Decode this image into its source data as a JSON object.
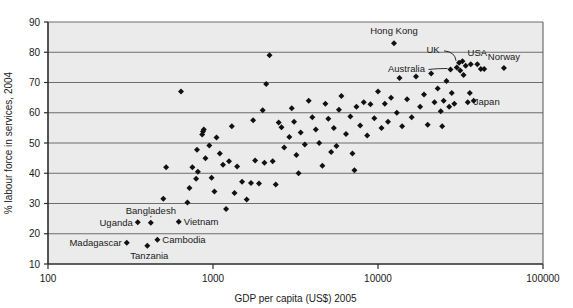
{
  "chart_data": {
    "type": "scatter",
    "title": "",
    "xlabel": "GDP per capita (US$) 2005",
    "ylabel": "% labour force in services, 2004",
    "xscale": "log",
    "yscale": "linear",
    "xlim": [
      100,
      100000
    ],
    "ylim": [
      10,
      90
    ],
    "xticks": [
      100,
      1000,
      10000,
      100000
    ],
    "xtick_labels": [
      "100",
      "1000",
      "10000",
      "100000"
    ],
    "yticks": [
      10,
      20,
      30,
      40,
      50,
      60,
      70,
      80,
      90
    ],
    "ytick_labels": [
      "10",
      "20",
      "30",
      "40",
      "50",
      "60",
      "70",
      "80",
      "90"
    ],
    "grid": "horizontal",
    "legend": "none",
    "marker": "diamond",
    "marker_color": "#111111",
    "plot_background": "#ebebeb",
    "points": [
      {
        "x": 300,
        "y": 17.0,
        "label": "Madagascar",
        "label_pos": "left"
      },
      {
        "x": 350,
        "y": 23.8,
        "label": "Uganda",
        "label_pos": "left"
      },
      {
        "x": 400,
        "y": 16.0,
        "label": "Tanzania",
        "label_pos": "below"
      },
      {
        "x": 420,
        "y": 23.6,
        "label": "Bangladesh",
        "label_pos": "above"
      },
      {
        "x": 460,
        "y": 18.0,
        "label": "Cambodia",
        "label_pos": "right"
      },
      {
        "x": 620,
        "y": 24.0,
        "label": "Vietnam",
        "label_pos": "right"
      },
      {
        "x": 12500,
        "y": 83.0,
        "label": "Hong Kong",
        "label_pos": "above"
      },
      {
        "x": 31000,
        "y": 76.5,
        "label": "UK",
        "label_pos": "leader-up-left"
      },
      {
        "x": 27500,
        "y": 74.3,
        "label": "Australia",
        "label_pos": "leader-left"
      },
      {
        "x": 40000,
        "y": 76.0,
        "label": "USA",
        "label_pos": "above"
      },
      {
        "x": 58000,
        "y": 74.8,
        "label": "Norway",
        "label_pos": "above"
      },
      {
        "x": 36000,
        "y": 66.5,
        "label": "Japan",
        "label_pos": "below-right"
      },
      {
        "x": 500,
        "y": 31.6,
        "label": "",
        "label_pos": ""
      },
      {
        "x": 520,
        "y": 42.0,
        "label": "",
        "label_pos": ""
      },
      {
        "x": 640,
        "y": 67.0,
        "label": "",
        "label_pos": ""
      },
      {
        "x": 700,
        "y": 30.3,
        "label": "",
        "label_pos": ""
      },
      {
        "x": 720,
        "y": 35.1,
        "label": "",
        "label_pos": ""
      },
      {
        "x": 750,
        "y": 42.0,
        "label": "",
        "label_pos": ""
      },
      {
        "x": 790,
        "y": 38.2,
        "label": "",
        "label_pos": ""
      },
      {
        "x": 800,
        "y": 47.8,
        "label": "",
        "label_pos": ""
      },
      {
        "x": 810,
        "y": 40.5,
        "label": "",
        "label_pos": ""
      },
      {
        "x": 860,
        "y": 52.8,
        "label": "",
        "label_pos": ""
      },
      {
        "x": 870,
        "y": 53.8,
        "label": "",
        "label_pos": ""
      },
      {
        "x": 880,
        "y": 54.5,
        "label": "",
        "label_pos": ""
      },
      {
        "x": 900,
        "y": 45.0,
        "label": "",
        "label_pos": ""
      },
      {
        "x": 950,
        "y": 49.2,
        "label": "",
        "label_pos": ""
      },
      {
        "x": 1050,
        "y": 51.8,
        "label": "",
        "label_pos": ""
      },
      {
        "x": 1100,
        "y": 46.5,
        "label": "",
        "label_pos": ""
      },
      {
        "x": 1150,
        "y": 42.8,
        "label": "",
        "label_pos": ""
      },
      {
        "x": 1200,
        "y": 28.2,
        "label": "",
        "label_pos": ""
      },
      {
        "x": 1250,
        "y": 44.0,
        "label": "",
        "label_pos": ""
      },
      {
        "x": 1300,
        "y": 55.5,
        "label": "",
        "label_pos": ""
      },
      {
        "x": 1400,
        "y": 42.2,
        "label": "",
        "label_pos": ""
      },
      {
        "x": 1500,
        "y": 37.2,
        "label": "",
        "label_pos": ""
      },
      {
        "x": 1600,
        "y": 31.3,
        "label": "",
        "label_pos": ""
      },
      {
        "x": 1700,
        "y": 36.8,
        "label": "",
        "label_pos": ""
      },
      {
        "x": 1750,
        "y": 57.5,
        "label": "",
        "label_pos": ""
      },
      {
        "x": 1900,
        "y": 36.6,
        "label": "",
        "label_pos": ""
      },
      {
        "x": 2000,
        "y": 60.8,
        "label": "",
        "label_pos": ""
      },
      {
        "x": 2100,
        "y": 69.5,
        "label": "",
        "label_pos": ""
      },
      {
        "x": 2200,
        "y": 79.0,
        "label": "",
        "label_pos": ""
      },
      {
        "x": 2300,
        "y": 44.0,
        "label": "",
        "label_pos": ""
      },
      {
        "x": 2400,
        "y": 36.3,
        "label": "",
        "label_pos": ""
      },
      {
        "x": 2500,
        "y": 56.8,
        "label": "",
        "label_pos": ""
      },
      {
        "x": 2600,
        "y": 55.2,
        "label": "",
        "label_pos": ""
      },
      {
        "x": 2700,
        "y": 48.5,
        "label": "",
        "label_pos": ""
      },
      {
        "x": 2900,
        "y": 52.0,
        "label": "",
        "label_pos": ""
      },
      {
        "x": 3000,
        "y": 61.5,
        "label": "",
        "label_pos": ""
      },
      {
        "x": 3100,
        "y": 57.0,
        "label": "",
        "label_pos": ""
      },
      {
        "x": 3200,
        "y": 46.0,
        "label": "",
        "label_pos": ""
      },
      {
        "x": 3400,
        "y": 53.5,
        "label": "",
        "label_pos": ""
      },
      {
        "x": 3600,
        "y": 49.5,
        "label": "",
        "label_pos": ""
      },
      {
        "x": 3800,
        "y": 64.0,
        "label": "",
        "label_pos": ""
      },
      {
        "x": 4000,
        "y": 58.5,
        "label": "",
        "label_pos": ""
      },
      {
        "x": 4200,
        "y": 54.5,
        "label": "",
        "label_pos": ""
      },
      {
        "x": 4400,
        "y": 50.0,
        "label": "",
        "label_pos": ""
      },
      {
        "x": 4600,
        "y": 42.5,
        "label": "",
        "label_pos": ""
      },
      {
        "x": 4800,
        "y": 63.0,
        "label": "",
        "label_pos": ""
      },
      {
        "x": 5000,
        "y": 58.0,
        "label": "",
        "label_pos": ""
      },
      {
        "x": 5200,
        "y": 47.0,
        "label": "",
        "label_pos": ""
      },
      {
        "x": 5400,
        "y": 55.0,
        "label": "",
        "label_pos": ""
      },
      {
        "x": 5600,
        "y": 49.0,
        "label": "",
        "label_pos": ""
      },
      {
        "x": 5800,
        "y": 61.0,
        "label": "",
        "label_pos": ""
      },
      {
        "x": 6000,
        "y": 65.5,
        "label": "",
        "label_pos": ""
      },
      {
        "x": 6400,
        "y": 53.0,
        "label": "",
        "label_pos": ""
      },
      {
        "x": 6800,
        "y": 58.8,
        "label": "",
        "label_pos": ""
      },
      {
        "x": 7000,
        "y": 46.5,
        "label": "",
        "label_pos": ""
      },
      {
        "x": 7400,
        "y": 62.0,
        "label": "",
        "label_pos": ""
      },
      {
        "x": 7800,
        "y": 55.8,
        "label": "",
        "label_pos": ""
      },
      {
        "x": 8200,
        "y": 63.5,
        "label": "",
        "label_pos": ""
      },
      {
        "x": 8600,
        "y": 52.5,
        "label": "",
        "label_pos": ""
      },
      {
        "x": 9000,
        "y": 62.8,
        "label": "",
        "label_pos": ""
      },
      {
        "x": 9500,
        "y": 58.2,
        "label": "",
        "label_pos": ""
      },
      {
        "x": 10000,
        "y": 67.0,
        "label": "",
        "label_pos": ""
      },
      {
        "x": 10500,
        "y": 55.0,
        "label": "",
        "label_pos": ""
      },
      {
        "x": 11000,
        "y": 63.0,
        "label": "",
        "label_pos": ""
      },
      {
        "x": 11500,
        "y": 57.0,
        "label": "",
        "label_pos": ""
      },
      {
        "x": 12000,
        "y": 65.0,
        "label": "",
        "label_pos": ""
      },
      {
        "x": 13000,
        "y": 60.0,
        "label": "",
        "label_pos": ""
      },
      {
        "x": 13500,
        "y": 71.5,
        "label": "",
        "label_pos": ""
      },
      {
        "x": 14000,
        "y": 55.5,
        "label": "",
        "label_pos": ""
      },
      {
        "x": 15000,
        "y": 64.5,
        "label": "",
        "label_pos": ""
      },
      {
        "x": 16000,
        "y": 58.5,
        "label": "",
        "label_pos": ""
      },
      {
        "x": 17000,
        "y": 72.0,
        "label": "",
        "label_pos": ""
      },
      {
        "x": 18000,
        "y": 62.0,
        "label": "",
        "label_pos": ""
      },
      {
        "x": 19000,
        "y": 66.0,
        "label": "",
        "label_pos": ""
      },
      {
        "x": 20000,
        "y": 56.0,
        "label": "",
        "label_pos": ""
      },
      {
        "x": 21000,
        "y": 73.0,
        "label": "",
        "label_pos": ""
      },
      {
        "x": 22000,
        "y": 63.5,
        "label": "",
        "label_pos": ""
      },
      {
        "x": 23000,
        "y": 68.0,
        "label": "",
        "label_pos": ""
      },
      {
        "x": 24000,
        "y": 60.5,
        "label": "",
        "label_pos": ""
      },
      {
        "x": 25000,
        "y": 64.0,
        "label": "",
        "label_pos": ""
      },
      {
        "x": 26000,
        "y": 70.5,
        "label": "",
        "label_pos": ""
      },
      {
        "x": 28000,
        "y": 66.5,
        "label": "",
        "label_pos": ""
      },
      {
        "x": 29000,
        "y": 63.0,
        "label": "",
        "label_pos": ""
      },
      {
        "x": 30000,
        "y": 75.0,
        "label": "",
        "label_pos": ""
      },
      {
        "x": 31500,
        "y": 74.0,
        "label": "",
        "label_pos": ""
      },
      {
        "x": 32500,
        "y": 77.0,
        "label": "",
        "label_pos": ""
      },
      {
        "x": 33000,
        "y": 72.5,
        "label": "",
        "label_pos": ""
      },
      {
        "x": 34000,
        "y": 75.5,
        "label": "",
        "label_pos": ""
      },
      {
        "x": 35000,
        "y": 63.5,
        "label": "",
        "label_pos": ""
      },
      {
        "x": 36500,
        "y": 76.0,
        "label": "",
        "label_pos": ""
      },
      {
        "x": 38000,
        "y": 64.0,
        "label": "",
        "label_pos": ""
      },
      {
        "x": 42000,
        "y": 74.5,
        "label": "",
        "label_pos": ""
      },
      {
        "x": 44000,
        "y": 74.5,
        "label": "",
        "label_pos": ""
      },
      {
        "x": 27000,
        "y": 62.0,
        "label": "",
        "label_pos": ""
      },
      {
        "x": 24500,
        "y": 55.5,
        "label": "",
        "label_pos": ""
      },
      {
        "x": 7200,
        "y": 41.0,
        "label": "",
        "label_pos": ""
      },
      {
        "x": 3300,
        "y": 40.0,
        "label": "",
        "label_pos": ""
      },
      {
        "x": 1800,
        "y": 44.2,
        "label": "",
        "label_pos": ""
      },
      {
        "x": 2050,
        "y": 43.5,
        "label": "",
        "label_pos": ""
      },
      {
        "x": 980,
        "y": 38.5,
        "label": "",
        "label_pos": ""
      },
      {
        "x": 1020,
        "y": 34.0,
        "label": "",
        "label_pos": ""
      },
      {
        "x": 1350,
        "y": 33.5,
        "label": "",
        "label_pos": ""
      }
    ],
    "annotations": [
      {
        "text": "Hong Kong",
        "type": "point-label"
      },
      {
        "text": "UK",
        "type": "point-label-leader"
      },
      {
        "text": "USA",
        "type": "point-label"
      },
      {
        "text": "Norway",
        "type": "point-label"
      },
      {
        "text": "Australia",
        "type": "point-label-leader"
      },
      {
        "text": "Japan",
        "type": "point-label"
      },
      {
        "text": "Bangladesh",
        "type": "point-label-leader"
      },
      {
        "text": "Uganda",
        "type": "point-label"
      },
      {
        "text": "Vietnam",
        "type": "point-label"
      },
      {
        "text": "Cambodia",
        "type": "point-label"
      },
      {
        "text": "Madagascar",
        "type": "point-label"
      },
      {
        "text": "Tanzania",
        "type": "point-label"
      }
    ]
  }
}
